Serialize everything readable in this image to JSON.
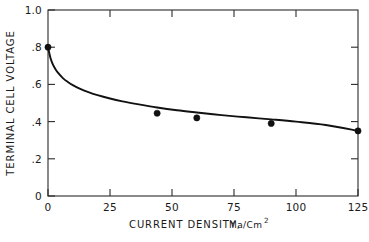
{
  "chart_data": {
    "type": "line",
    "title": "",
    "xlabel": "CURRENT DENSITY, Ma/Cm",
    "xlabel_superscript": "2",
    "xlabel_main": "CURRENT DENSITY,",
    "xlabel_unit": "Ma/Cm",
    "ylabel": "TERMINAL CELL VOLTAGE",
    "xlim": [
      0,
      125
    ],
    "ylim": [
      0,
      1.0
    ],
    "grid": false,
    "legend": null,
    "x_ticks": [
      0,
      25,
      50,
      75,
      100,
      125
    ],
    "x_tick_labels": [
      "0",
      "25",
      "50",
      "75",
      "100",
      "125"
    ],
    "y_ticks": [
      0,
      0.2,
      0.4,
      0.6,
      0.8,
      1.0
    ],
    "y_tick_labels": [
      "0",
      ".2",
      ".4",
      ".6",
      ".8",
      "1.0"
    ],
    "series": [
      {
        "name": "terminal cell voltage",
        "marker": "filled-circle",
        "x": [
          0,
          44,
          60,
          90,
          125
        ],
        "y": [
          0.8,
          0.445,
          0.42,
          0.39,
          0.35
        ]
      }
    ],
    "curve_points": {
      "x": [
        0,
        1,
        2,
        3,
        4,
        6,
        8,
        10,
        13,
        16,
        20,
        25,
        30,
        36,
        44,
        52,
        60,
        70,
        80,
        90,
        100,
        112,
        125
      ],
      "y": [
        0.8,
        0.742,
        0.706,
        0.682,
        0.663,
        0.634,
        0.613,
        0.596,
        0.576,
        0.56,
        0.542,
        0.524,
        0.509,
        0.494,
        0.476,
        0.461,
        0.449,
        0.435,
        0.423,
        0.412,
        0.4,
        0.382,
        0.35
      ]
    }
  },
  "axis": {
    "y_title": "TERMINAL CELL VOLTAGE",
    "x_title_main": "CURRENT DENSITY,",
    "x_title_unit": "Ma/Cm",
    "x_title_sup": "2",
    "y_labels": [
      "1.0",
      ".8",
      ".6",
      ".4",
      ".2",
      "0"
    ],
    "x_labels": [
      "0",
      "25",
      "50",
      "75",
      "100",
      "125"
    ]
  }
}
